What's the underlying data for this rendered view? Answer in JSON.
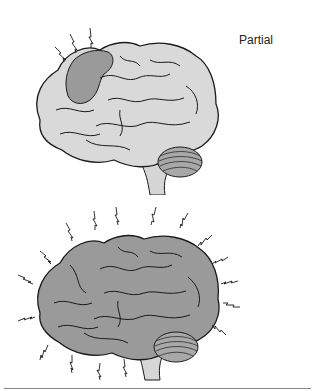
{
  "figure": {
    "panels": [
      {
        "label": "Partial",
        "description": "Lateral view of brain with focal shaded region in frontal area and three lightning bolts above it",
        "brain_fill": "#d9d9d9",
        "focus_fill": "#9a9a9a",
        "bolt_count": 3
      },
      {
        "label": "Generalized",
        "description": "Lateral view of fully shaded brain surrounded by lightning bolts on all sides",
        "brain_fill": "#9a9a9a",
        "bolt_count": 18
      }
    ],
    "colors": {
      "outline": "#1a1a1a",
      "light_brain": "#d9d9d9",
      "dark_brain": "#9a9a9a",
      "cerebellum": "#a8a8a8",
      "brainstem": "#d6d6d6",
      "rule": "#888888"
    }
  }
}
